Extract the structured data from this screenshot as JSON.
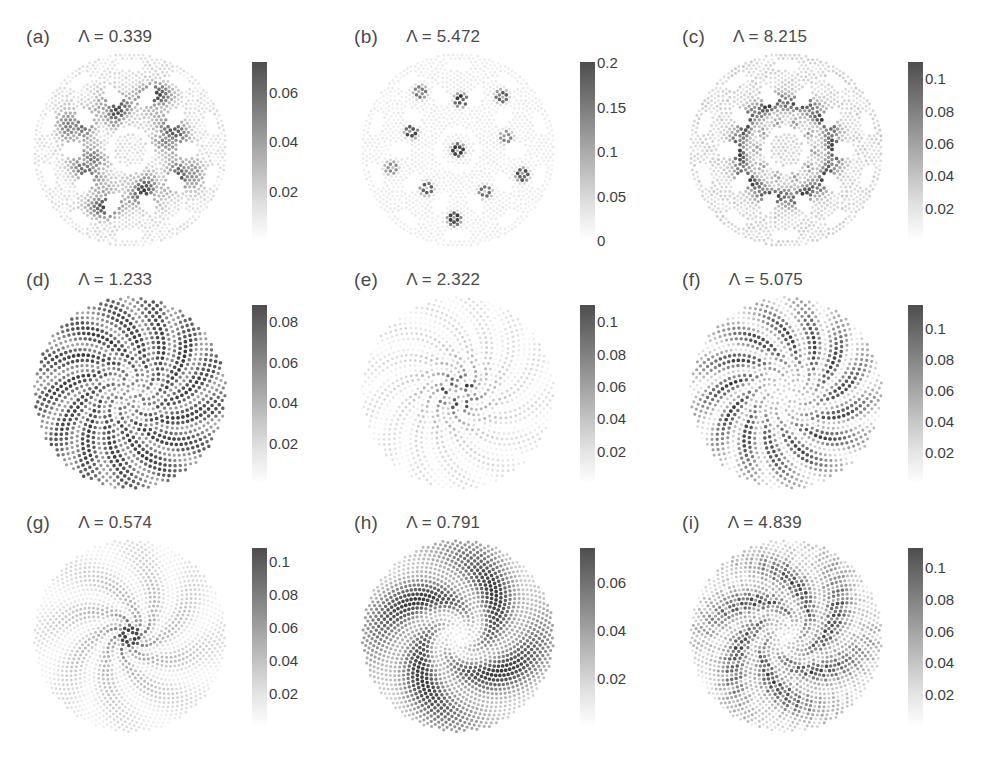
{
  "figure": {
    "background": "#ffffff",
    "rows": 3,
    "cols": 3,
    "symbol": "Λ"
  },
  "chart_data": {
    "type": "scatter",
    "title": "",
    "xlabel": "",
    "ylabel": "",
    "colormap": {
      "name": "grayscale-reversed",
      "low_color": "#ffffff",
      "high_color": "#4d4d4d"
    },
    "panels": [
      {
        "tag": "(a)",
        "label": "Λ = 0.339",
        "lambda": 0.339,
        "lattice": "quasicrystal",
        "pattern": "localized-clusters",
        "n_points": 1400,
        "symmetry": 10,
        "cbar": {
          "min": 0,
          "max": 0.072,
          "ticks": [
            0.02,
            0.04,
            0.06
          ],
          "tick_labels": [
            "0.02",
            "0.04",
            "0.06"
          ]
        }
      },
      {
        "tag": "(b)",
        "label": "Λ = 5.472",
        "lambda": 5.472,
        "lattice": "quasicrystal",
        "pattern": "ring-defects",
        "n_points": 1400,
        "symmetry": 10,
        "cbar": {
          "min": 0,
          "max": 0.2,
          "ticks": [
            0,
            0.05,
            0.1,
            0.15,
            0.2
          ],
          "tick_labels": [
            "0",
            "0.05",
            "0.1",
            "0.15",
            "0.2"
          ]
        }
      },
      {
        "tag": "(c)",
        "label": "Λ = 8.215",
        "lambda": 8.215,
        "lattice": "quasicrystal",
        "pattern": "decagonal-ring",
        "n_points": 1400,
        "symmetry": 10,
        "cbar": {
          "min": 0,
          "max": 0.11,
          "ticks": [
            0.02,
            0.04,
            0.06,
            0.08,
            0.1
          ],
          "tick_labels": [
            "0.02",
            "0.04",
            "0.06",
            "0.08",
            "0.1"
          ]
        }
      },
      {
        "tag": "(d)",
        "label": "Λ = 1.233",
        "lambda": 1.233,
        "lattice": "vogel-spiral",
        "pattern": "spiral-arms",
        "n_points": 1100,
        "symmetry": 13,
        "cbar": {
          "min": 0,
          "max": 0.088,
          "ticks": [
            0.02,
            0.04,
            0.06,
            0.08
          ],
          "tick_labels": [
            "0.02",
            "0.04",
            "0.06",
            "0.08"
          ]
        }
      },
      {
        "tag": "(e)",
        "label": "Λ = 2.322",
        "lambda": 2.322,
        "lattice": "vogel-spiral",
        "pattern": "spiral-arms-core",
        "n_points": 1100,
        "symmetry": 13,
        "cbar": {
          "min": 0,
          "max": 0.11,
          "ticks": [
            0.02,
            0.04,
            0.06,
            0.08,
            0.1
          ],
          "tick_labels": [
            "0.02",
            "0.04",
            "0.06",
            "0.08",
            "0.1"
          ]
        }
      },
      {
        "tag": "(f)",
        "label": "Λ = 5.075",
        "lambda": 5.075,
        "lattice": "vogel-spiral",
        "pattern": "spiral-arms-outer",
        "n_points": 1100,
        "symmetry": 13,
        "cbar": {
          "min": 0,
          "max": 0.115,
          "ticks": [
            0.02,
            0.04,
            0.06,
            0.08,
            0.1
          ],
          "tick_labels": [
            "0.02",
            "0.04",
            "0.06",
            "0.08",
            "0.1"
          ]
        }
      },
      {
        "tag": "(g)",
        "label": "Λ = 0.574",
        "lambda": 0.574,
        "lattice": "vogel-spiral",
        "pattern": "bright-core",
        "n_points": 1500,
        "symmetry": 8,
        "cbar": {
          "min": 0,
          "max": 0.108,
          "ticks": [
            0.02,
            0.04,
            0.06,
            0.08,
            0.1
          ],
          "tick_labels": [
            "0.02",
            "0.04",
            "0.06",
            "0.08",
            "0.1"
          ]
        }
      },
      {
        "tag": "(h)",
        "label": "Λ = 0.791",
        "lambda": 0.791,
        "lattice": "vogel-spiral",
        "pattern": "four-lobes",
        "n_points": 1500,
        "symmetry": 4,
        "cbar": {
          "min": 0,
          "max": 0.074,
          "ticks": [
            0.02,
            0.04,
            0.06
          ],
          "tick_labels": [
            "0.02",
            "0.04",
            "0.06"
          ]
        }
      },
      {
        "tag": "(i)",
        "label": "Λ = 4.839",
        "lambda": 4.839,
        "lattice": "vogel-spiral",
        "pattern": "scattered-speckle",
        "n_points": 1500,
        "symmetry": 6,
        "cbar": {
          "min": 0,
          "max": 0.112,
          "ticks": [
            0.02,
            0.04,
            0.06,
            0.08,
            0.1
          ],
          "tick_labels": [
            "0.02",
            "0.04",
            "0.06",
            "0.08",
            "0.1"
          ]
        }
      }
    ]
  }
}
